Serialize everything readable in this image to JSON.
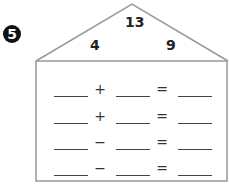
{
  "problem": {
    "number": "5",
    "roof": {
      "total": "13",
      "left_part": "4",
      "right_part": "9"
    },
    "equations": [
      {
        "operator": "+",
        "equals": "="
      },
      {
        "operator": "+",
        "equals": "="
      },
      {
        "operator": "−",
        "equals": "="
      },
      {
        "operator": "−",
        "equals": "="
      }
    ]
  }
}
